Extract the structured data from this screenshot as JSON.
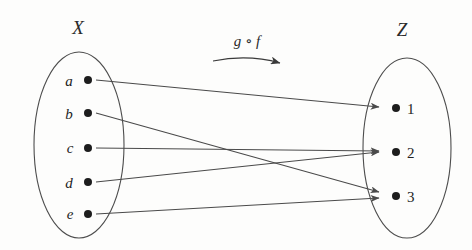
{
  "diagram": {
    "kind": "function-composition-mapping-diagram",
    "background_color": "#fdfdfc",
    "line_color": "#4a4a4a",
    "dot_color": "#1d1d1d",
    "sets": [
      {
        "id": "X",
        "label": "X",
        "label_x": 78,
        "label_y": 34,
        "cx": 79,
        "cy": 145,
        "rx": 45,
        "ry": 93,
        "elements": [
          {
            "label": "a",
            "dot_x": 88,
            "dot_y": 80,
            "text_x": 69,
            "text_y": 86
          },
          {
            "label": "b",
            "dot_x": 88,
            "dot_y": 113,
            "text_x": 69,
            "text_y": 119
          },
          {
            "label": "c",
            "dot_x": 88,
            "dot_y": 148,
            "text_x": 70,
            "text_y": 153
          },
          {
            "label": "d",
            "dot_x": 88,
            "dot_y": 182,
            "text_x": 69,
            "text_y": 188
          },
          {
            "label": "e",
            "dot_x": 88,
            "dot_y": 214,
            "text_x": 70,
            "text_y": 219
          }
        ]
      },
      {
        "id": "Z",
        "label": "Z",
        "label_x": 402,
        "label_y": 36,
        "cx": 407,
        "cy": 148,
        "rx": 44,
        "ry": 90,
        "elements": [
          {
            "label": "1",
            "dot_x": 396,
            "dot_y": 108,
            "text_x": 407,
            "text_y": 114
          },
          {
            "label": "2",
            "dot_x": 396,
            "dot_y": 152,
            "text_x": 407,
            "text_y": 158
          },
          {
            "label": "3",
            "dot_x": 396,
            "dot_y": 196,
            "text_x": 407,
            "text_y": 202
          }
        ]
      }
    ],
    "mapping_label": {
      "text": "g ∘ f",
      "x": 247,
      "y": 46
    },
    "mapping_arrow": {
      "path": "M 213 61 Q 248 54 280 63",
      "head_x": 281,
      "head_y": 63
    },
    "arrows": [
      {
        "id": "a-to-1",
        "from": "a",
        "to": "1",
        "x1": 96,
        "y1": 80,
        "x2": 379,
        "y2": 107
      },
      {
        "id": "b-to-3",
        "from": "b",
        "to": "3",
        "x1": 96,
        "y1": 113,
        "x2": 379,
        "y2": 192
      },
      {
        "id": "c-to-2",
        "from": "c",
        "to": "2",
        "x1": 96,
        "y1": 148,
        "x2": 379,
        "y2": 151
      },
      {
        "id": "d-to-2",
        "from": "d",
        "to": "2",
        "x1": 96,
        "y1": 182,
        "x2": 379,
        "y2": 152
      },
      {
        "id": "e-to-3",
        "from": "e",
        "to": "3",
        "x1": 96,
        "y1": 214,
        "x2": 379,
        "y2": 198
      }
    ]
  }
}
